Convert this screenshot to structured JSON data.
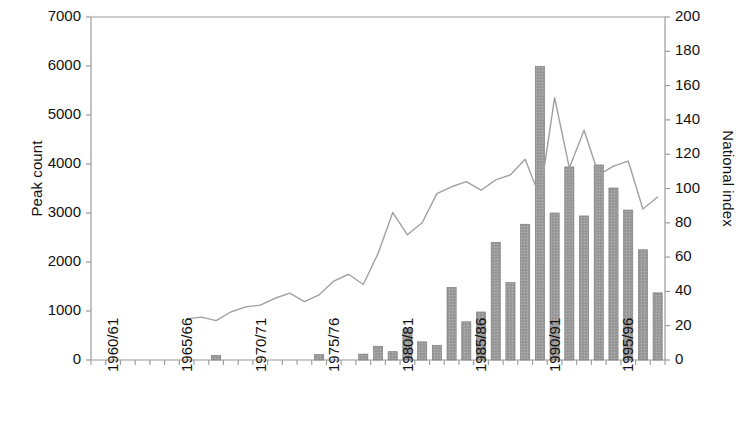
{
  "chart_data": {
    "type": "bar",
    "title": "",
    "subtitle": "",
    "xlabel": "",
    "ylabel": "Peak count",
    "y2label": "National index",
    "ylim": [
      0,
      7000
    ],
    "y2lim": [
      0,
      200
    ],
    "grid": false,
    "legend": false,
    "legend_position": "none",
    "y_ticks": [
      0,
      1000,
      2000,
      3000,
      4000,
      5000,
      6000,
      7000
    ],
    "y2_ticks": [
      0,
      20,
      40,
      60,
      80,
      100,
      120,
      140,
      160,
      180,
      200
    ],
    "x_tick_labels": [
      "1960/61",
      "1965/66",
      "1970/71",
      "1975/76",
      "1980/81",
      "1985/86",
      "1990/91",
      "1995/96"
    ],
    "x_tick_categories": [
      "1960/61",
      "1965/66",
      "1970/71",
      "1975/76",
      "1980/81",
      "1985/86",
      "1990/91",
      "1995/96"
    ],
    "categories": [
      "1960/61",
      "1961/62",
      "1962/63",
      "1963/64",
      "1964/65",
      "1965/66",
      "1966/67",
      "1967/68",
      "1968/69",
      "1969/70",
      "1970/71",
      "1971/72",
      "1972/73",
      "1973/74",
      "1974/75",
      "1975/76",
      "1976/77",
      "1977/78",
      "1978/79",
      "1979/80",
      "1980/81",
      "1981/82",
      "1982/83",
      "1983/84",
      "1984/85",
      "1985/86",
      "1986/87",
      "1987/88",
      "1988/89",
      "1989/90",
      "1990/91",
      "1991/92",
      "1992/93",
      "1993/94",
      "1994/95",
      "1995/96",
      "1996/97",
      "1997/98",
      "1998/99"
    ],
    "series": [
      {
        "name": "Peak count",
        "type": "bar",
        "axis": "left",
        "color": "#9a9a9a",
        "values": [
          0,
          0,
          0,
          0,
          0,
          0,
          0,
          0,
          90,
          0,
          0,
          0,
          0,
          0,
          0,
          110,
          0,
          0,
          120,
          280,
          170,
          620,
          370,
          300,
          1480,
          780,
          980,
          2400,
          1580,
          2770,
          5990,
          3000,
          3940,
          2940,
          3980,
          3510,
          3060,
          2250,
          1370
        ]
      },
      {
        "name": "National index",
        "type": "line",
        "axis": "right",
        "color": "#a0a0a0",
        "x_start_category": "1966/67",
        "values": [
          null,
          null,
          null,
          null,
          null,
          null,
          24,
          25,
          23,
          28,
          31,
          32,
          36,
          39,
          34,
          38,
          46,
          50,
          44,
          62,
          86,
          73,
          80,
          97,
          101,
          104,
          99,
          105,
          108,
          117,
          95,
          153,
          112,
          134,
          108,
          113,
          116,
          88,
          95
        ]
      }
    ]
  }
}
